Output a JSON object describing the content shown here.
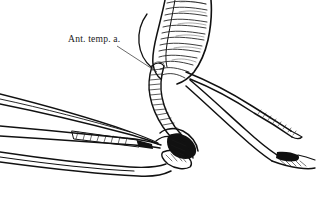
{
  "figure": {
    "kind": "anatomical-line-drawing",
    "background_color": "#ffffff",
    "ink_color": "#111111",
    "width": 316,
    "height": 205
  },
  "labels": [
    {
      "id": "ant-temp-a",
      "text": "Ant. temp. a.",
      "x": 68,
      "y": 42,
      "leader_from_x": 117,
      "leader_from_y": 46,
      "leader_to_x": 157,
      "leader_to_y": 72
    }
  ],
  "structures": {
    "muscle_band": "hatched temporal muscle band descending from top edge",
    "vessel_main": "anterior temporal artery curving to lower right",
    "vessel_branch": "secondary vessel branch with clamped cut end at lower right",
    "forceps": "two-bladed forceps entering from left, tips meeting tissue at center",
    "anastomosis": "dense hatched junction at center-bottom where vessels converge"
  }
}
